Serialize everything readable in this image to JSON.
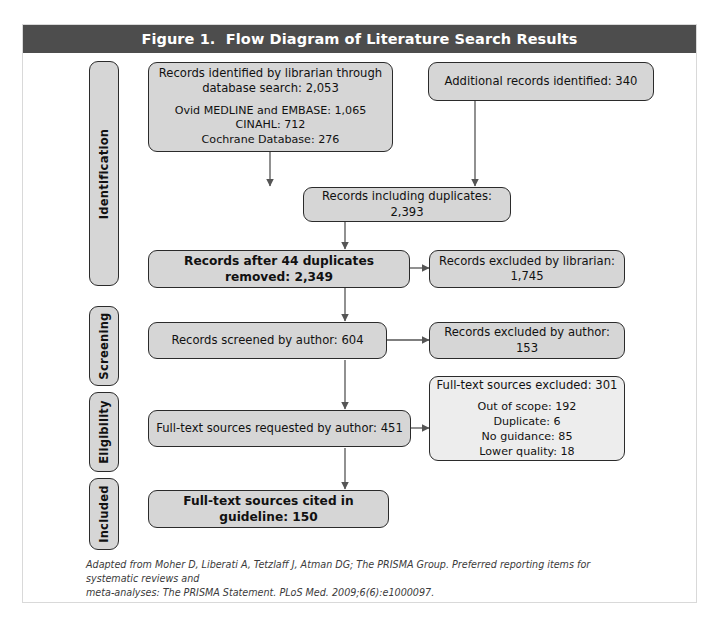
{
  "figure": {
    "title": "Figure 1.  Flow Diagram of Literature Search Results",
    "title_bar_color": "#4d4d4d",
    "frame_border_color": "#d9d9d9",
    "node_fill": "#d6d6d6",
    "node_light_fill": "#ededed",
    "node_border": "#2b2b2b",
    "connector_color": "#555555"
  },
  "stages": [
    {
      "id": "identification",
      "label": "Identification"
    },
    {
      "id": "screening",
      "label": "Screening"
    },
    {
      "id": "eligibility",
      "label": "Eligibility"
    },
    {
      "id": "included",
      "label": "Included"
    }
  ],
  "nodes": {
    "records_identified": {
      "primary_line_1": "Records identified by librarian through",
      "primary_line_2": "database search: 2,053",
      "detail": [
        "Ovid MEDLINE and EMBASE: 1,065",
        "CINAHL: 712",
        "Cochrane Database: 276"
      ]
    },
    "additional_records": {
      "text": "Additional records identified: 340"
    },
    "records_including_duplicates": {
      "text": "Records including duplicates: 2,393"
    },
    "records_after_duplicates": {
      "text": "Records after 44 duplicates removed: 2,349"
    },
    "excluded_by_librarian": {
      "text": "Records excluded by librarian: 1,745"
    },
    "records_screened": {
      "text": "Records screened by author: 604"
    },
    "excluded_by_author": {
      "text": "Records excluded by author: 153"
    },
    "fulltext_requested": {
      "text": "Full-text sources requested by author: 451"
    },
    "fulltext_excluded": {
      "primary": "Full-text sources excluded: 301",
      "detail": [
        "Out of scope: 192",
        "Duplicate: 6",
        "No guidance: 85",
        "Lower quality: 18"
      ]
    },
    "fulltext_cited": {
      "text": "Full-text sources cited in guideline: 150"
    }
  },
  "footnote": {
    "line_1": "Adapted from Moher D, Liberati A, Tetzlaff J, Atman DG; The PRISMA Group. Preferred reporting items for systematic reviews and",
    "line_2": "meta-analyses: The PRISMA Statement. PLoS Med. 2009;6(6):e1000097."
  },
  "flow_data": {
    "type": "diagram",
    "counts": {
      "records_identified_database": 2053,
      "ovid_medline_embase": 1065,
      "cinahl": 712,
      "cochrane_database": 276,
      "additional_records": 340,
      "records_including_duplicates": 2393,
      "duplicates_removed": 44,
      "records_after_duplicates_removed": 2349,
      "excluded_by_librarian": 1745,
      "records_screened": 604,
      "excluded_by_author": 153,
      "fulltext_requested": 451,
      "fulltext_excluded": 301,
      "excluded_out_of_scope": 192,
      "excluded_duplicate": 6,
      "excluded_no_guidance": 85,
      "excluded_lower_quality": 18,
      "fulltext_cited": 150
    }
  }
}
